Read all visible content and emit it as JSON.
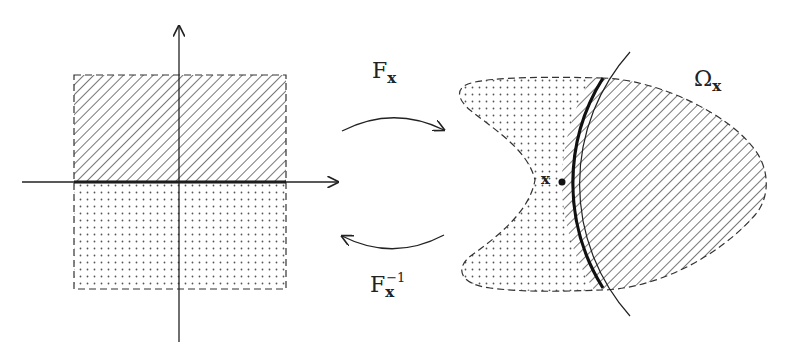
{
  "diagram": {
    "left_domain": {
      "upper_region_fill": "hatched",
      "lower_region_fill": "dotted",
      "boundary": "horizontal axis segment (thick)"
    },
    "forward_map": {
      "base": "F",
      "subscript": "x",
      "superscript": ""
    },
    "inverse_map": {
      "base": "F",
      "subscript": "x",
      "superscript": "−1"
    },
    "right_domain": {
      "region_label": {
        "base": "Ω",
        "subscript": "x"
      },
      "point_label": "x",
      "hatched_side": "inside curve",
      "dotted_side": "outside curve"
    },
    "colors": {
      "ink": "#222222",
      "hatch": "#555555",
      "dot": "#555555",
      "background": "#ffffff"
    }
  }
}
